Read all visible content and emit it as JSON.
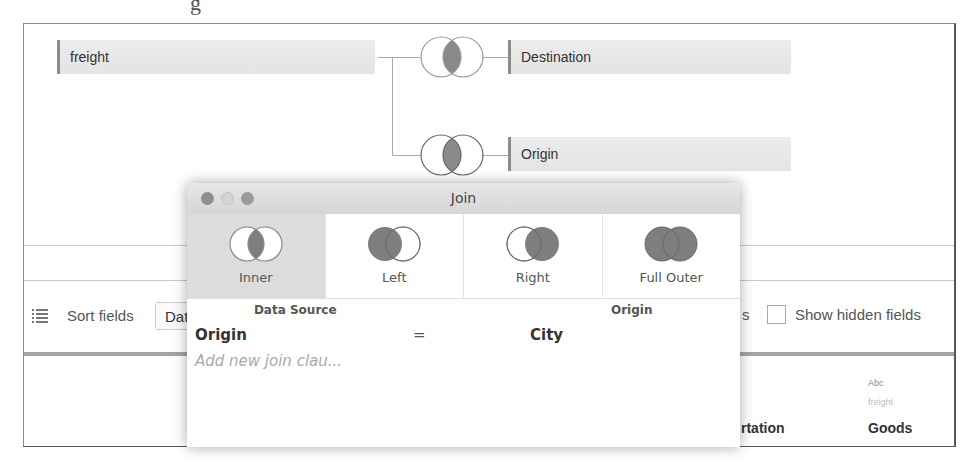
{
  "page_fragment": "g",
  "canvas": {
    "tables": {
      "left": "freight",
      "right_top": "Destination",
      "right_bottom": "Origin"
    },
    "join_icons": [
      {
        "type": "inner",
        "target": "Destination"
      },
      {
        "type": "inner",
        "target": "Origin"
      }
    ]
  },
  "toolbar": {
    "sort_label": "Sort fields",
    "sort_value": "Data Source",
    "partial_label_fragment": "s",
    "show_hidden_label": "Show hidden fields",
    "show_hidden_checked": false
  },
  "grid": {
    "partial_column_name": "rtation",
    "columns": [
      {
        "type": "Abc",
        "source": "freight",
        "name": "Goods"
      }
    ]
  },
  "join_dialog": {
    "title": "Join",
    "join_types": [
      {
        "id": "inner",
        "label": "Inner",
        "selected": true
      },
      {
        "id": "left",
        "label": "Left",
        "selected": false
      },
      {
        "id": "right",
        "label": "Right",
        "selected": false
      },
      {
        "id": "full-outer",
        "label": "Full Outer",
        "selected": false
      }
    ],
    "clause_header": {
      "left": "Data Source",
      "right": "Origin"
    },
    "clauses": [
      {
        "left": "Origin",
        "operator": "=",
        "right": "City"
      }
    ],
    "add_clause_placeholder": "Add new join clau..."
  },
  "colors": {
    "venn_fill": "#8a8a8a",
    "venn_stroke": "#9a9a9a",
    "selected_tab": "#dcdcdc",
    "table_box": "#e8e8e8"
  }
}
